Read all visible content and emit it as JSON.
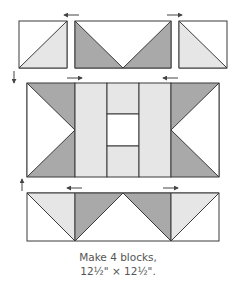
{
  "colors": {
    "outline": "#3a3a3a",
    "dark_fabric": "#a9a9a9",
    "light_fabric": "#e6e6e6",
    "white_fabric": "#ffffff",
    "arrow": "#444444",
    "caption_text": "#555555"
  },
  "caption": {
    "line1": "Make 4 blocks,",
    "line2": "12½\" × 12½\"."
  },
  "diagram": {
    "top_row": {
      "units": [
        "half-square-triangle-left",
        "flying-geese-center",
        "half-square-triangle-right"
      ],
      "press_arrows": [
        "left",
        "right"
      ]
    },
    "middle_row": {
      "units": [
        "flying-geese-left",
        "light-strip",
        "center-column",
        "light-strip",
        "flying-geese-right"
      ],
      "press_arrows": [
        "right",
        "left"
      ]
    },
    "bottom_row": {
      "units": [
        "flying-geese-left",
        "flying-geese-right"
      ],
      "press_arrows": [
        "left",
        "right"
      ]
    },
    "row_arrows": [
      "down",
      "up"
    ]
  }
}
